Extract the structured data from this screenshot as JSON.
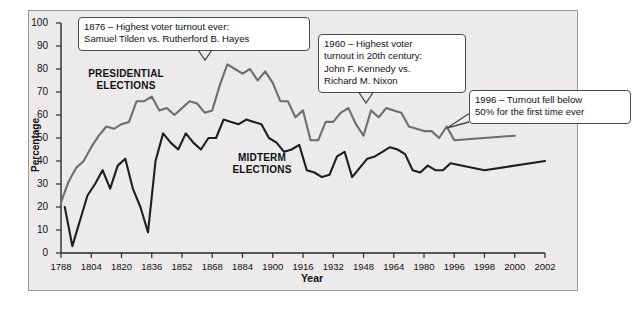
{
  "chart_data": {
    "type": "line",
    "title": "",
    "xlabel": "Year",
    "ylabel": "Percentage",
    "ylim": [
      0,
      100
    ],
    "yticks": [
      0,
      10,
      20,
      30,
      40,
      50,
      60,
      70,
      80,
      90,
      100
    ],
    "xticks": [
      "1788",
      "1804",
      "1820",
      "1836",
      "1852",
      "1868",
      "1884",
      "1900",
      "1916",
      "1932",
      "1948",
      "1964",
      "1980",
      "1996",
      "1998",
      "2000",
      "2002"
    ],
    "grid": false,
    "legend_position": "inline-labels",
    "series": [
      {
        "name": "PRESIDENTIAL ELECTIONS",
        "color": "#6e6e6e",
        "x": [
          1788,
          1792,
          1796,
          1800,
          1804,
          1808,
          1812,
          1816,
          1820,
          1824,
          1828,
          1832,
          1836,
          1840,
          1844,
          1848,
          1852,
          1856,
          1860,
          1864,
          1868,
          1872,
          1876,
          1880,
          1884,
          1888,
          1892,
          1896,
          1900,
          1904,
          1908,
          1912,
          1916,
          1920,
          1924,
          1928,
          1932,
          1936,
          1940,
          1944,
          1948,
          1952,
          1956,
          1960,
          1964,
          1968,
          1972,
          1976,
          1980,
          1984,
          1988,
          1992,
          1996,
          2000
        ],
        "values": [
          22,
          31,
          37,
          40,
          46,
          51,
          55,
          54,
          56,
          57,
          66,
          66,
          68,
          62,
          63,
          60,
          63,
          66,
          65,
          61,
          62,
          73,
          82,
          80,
          78,
          80,
          75,
          79,
          74,
          66,
          66,
          59,
          62,
          49,
          49,
          57,
          57,
          61,
          63,
          56,
          51,
          62,
          59,
          63,
          62,
          61,
          55,
          54,
          53,
          53,
          50,
          55,
          49,
          51
        ]
      },
      {
        "name": "MIDTERM ELECTIONS",
        "color": "#1e1e1e",
        "x": [
          1790,
          1794,
          1798,
          1802,
          1806,
          1810,
          1814,
          1818,
          1822,
          1826,
          1830,
          1834,
          1838,
          1842,
          1846,
          1850,
          1854,
          1858,
          1862,
          1866,
          1870,
          1874,
          1878,
          1882,
          1886,
          1890,
          1894,
          1898,
          1902,
          1906,
          1910,
          1914,
          1918,
          1922,
          1926,
          1930,
          1934,
          1938,
          1942,
          1946,
          1950,
          1954,
          1958,
          1962,
          1966,
          1970,
          1974,
          1978,
          1982,
          1986,
          1990,
          1994,
          1998,
          2002
        ],
        "values": [
          20,
          3,
          14,
          25,
          30,
          36,
          28,
          38,
          41,
          28,
          20,
          9,
          40,
          52,
          48,
          45,
          52,
          48,
          45,
          50,
          50,
          58,
          57,
          56,
          58,
          57,
          56,
          50,
          48,
          44,
          45,
          47,
          36,
          35,
          33,
          34,
          42,
          44,
          33,
          37,
          41,
          42,
          44,
          46,
          45,
          43,
          36,
          35,
          38,
          36,
          36,
          39,
          36,
          40
        ]
      }
    ],
    "annotations": [
      {
        "id": "1876",
        "text": "1876 – Highest voter turnout ever:\nSamuel Tilden vs. Rutherford B. Hayes"
      },
      {
        "id": "1960",
        "text": "1960 – Highest voter\nturnout in 20th century:\nJohn F. Kennedy vs.\nRichard M. Nixon"
      },
      {
        "id": "1996",
        "text": "1996 – Turnout fell below\n50% for the first time ever"
      }
    ],
    "series_labels": [
      {
        "line1": "PRESIDENTIAL",
        "line2": "ELECTIONS"
      },
      {
        "line1": "MIDTERM",
        "line2": "ELECTIONS"
      }
    ]
  }
}
